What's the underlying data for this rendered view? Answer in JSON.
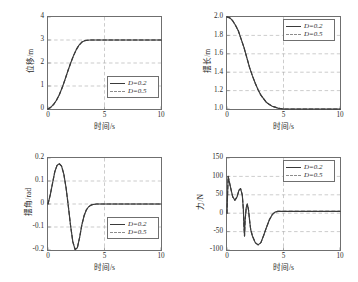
{
  "figure": {
    "background": "#ffffff",
    "axis_color": "#6f6f6f",
    "grid_color": "#a9a9a9",
    "curve_color": "#3a3a3a",
    "dashed_color": "#8d8d8d",
    "caption": ""
  },
  "legend": {
    "series": [
      {
        "label": "D=0.2",
        "style": "solid"
      },
      {
        "label": "D=0.5",
        "style": "dashed"
      }
    ]
  },
  "chart_data": [
    {
      "type": "line",
      "id": "displacement",
      "position": "top-left",
      "title": "",
      "xlabel": "时间/s",
      "ylabel": "位移/m",
      "xlim": [
        0,
        10
      ],
      "ylim": [
        0,
        4
      ],
      "xticks": [
        0,
        5,
        10
      ],
      "yticks": [
        0,
        1,
        2,
        3,
        4
      ],
      "grid": true,
      "legend_position": "lower-right",
      "series": [
        {
          "name": "D=0.2",
          "style": "solid",
          "x": [
            0,
            0.25,
            0.5,
            0.75,
            1.0,
            1.25,
            1.5,
            1.75,
            2.0,
            2.25,
            2.5,
            2.75,
            3.0,
            3.25,
            3.5,
            3.75,
            4.0,
            4.5,
            5.0,
            6.0,
            7.0,
            8.0,
            9.0,
            10.0
          ],
          "y": [
            0.0,
            0.08,
            0.2,
            0.38,
            0.62,
            0.92,
            1.27,
            1.64,
            1.99,
            2.31,
            2.58,
            2.78,
            2.91,
            2.97,
            2.99,
            3.0,
            3.0,
            3.0,
            3.0,
            3.0,
            3.0,
            3.0,
            3.0,
            3.0
          ]
        },
        {
          "name": "D=0.5",
          "style": "dashed",
          "x": [
            0,
            0.25,
            0.5,
            0.75,
            1.0,
            1.25,
            1.5,
            1.75,
            2.0,
            2.25,
            2.5,
            2.75,
            3.0,
            3.25,
            3.5,
            3.75,
            4.0,
            4.5,
            5.0,
            6.0,
            7.0,
            8.0,
            9.0,
            10.0
          ],
          "y": [
            0.0,
            0.08,
            0.2,
            0.38,
            0.62,
            0.92,
            1.27,
            1.64,
            1.99,
            2.31,
            2.58,
            2.78,
            2.91,
            2.97,
            2.99,
            3.0,
            3.0,
            3.0,
            3.0,
            3.0,
            3.0,
            3.0,
            3.0,
            3.0
          ]
        }
      ]
    },
    {
      "type": "line",
      "id": "pendulum-length",
      "position": "top-right",
      "title": "",
      "xlabel": "时间/s",
      "ylabel": "摆长/m",
      "xlim": [
        0,
        10
      ],
      "ylim": [
        1.0,
        2.0
      ],
      "xticks": [
        0,
        5,
        10
      ],
      "yticks": [
        1.0,
        1.2,
        1.4,
        1.6,
        1.8,
        2.0
      ],
      "ytick_labels": [
        "1.0",
        "1.2",
        "1.4",
        "1.6",
        "1.8",
        "2.0"
      ],
      "grid": true,
      "legend_position": "upper-right",
      "series": [
        {
          "name": "D=0.2",
          "style": "solid",
          "x": [
            0,
            0.25,
            0.5,
            0.75,
            1.0,
            1.25,
            1.5,
            1.75,
            2.0,
            2.25,
            2.5,
            2.75,
            3.0,
            3.25,
            3.5,
            3.75,
            4.0,
            4.25,
            4.5,
            5.0,
            5.5,
            6.0,
            7.0,
            8.0,
            9.0,
            10.0
          ],
          "y": [
            2.0,
            1.99,
            1.96,
            1.91,
            1.85,
            1.76,
            1.67,
            1.56,
            1.45,
            1.36,
            1.28,
            1.21,
            1.15,
            1.11,
            1.07,
            1.05,
            1.03,
            1.02,
            1.01,
            1.0,
            1.0,
            1.0,
            1.0,
            1.0,
            1.0,
            1.0
          ]
        },
        {
          "name": "D=0.5",
          "style": "dashed",
          "x": [
            0,
            0.25,
            0.5,
            0.75,
            1.0,
            1.25,
            1.5,
            1.75,
            2.0,
            2.25,
            2.5,
            2.75,
            3.0,
            3.25,
            3.5,
            3.75,
            4.0,
            4.25,
            4.5,
            5.0,
            5.5,
            6.0,
            7.0,
            8.0,
            9.0,
            10.0
          ],
          "y": [
            2.0,
            1.99,
            1.96,
            1.91,
            1.85,
            1.76,
            1.67,
            1.56,
            1.45,
            1.36,
            1.28,
            1.21,
            1.15,
            1.11,
            1.07,
            1.05,
            1.03,
            1.02,
            1.01,
            1.0,
            1.0,
            1.0,
            1.0,
            1.0,
            1.0,
            1.0
          ]
        }
      ]
    },
    {
      "type": "line",
      "id": "swing-angle",
      "position": "bottom-left",
      "title": "",
      "xlabel": "时间/s",
      "ylabel": "摆角/rad",
      "xlim": [
        0,
        10
      ],
      "ylim": [
        -0.2,
        0.2
      ],
      "xticks": [
        0,
        5,
        10
      ],
      "yticks": [
        -0.2,
        -0.1,
        0,
        0.1,
        0.2
      ],
      "ytick_labels": [
        "-0.2",
        "-0.1",
        "0",
        "0.1",
        "0.2"
      ],
      "grid": true,
      "legend_position": "lower-right",
      "series": [
        {
          "name": "D=0.2",
          "style": "solid",
          "x": [
            0,
            0.2,
            0.4,
            0.6,
            0.8,
            1.0,
            1.2,
            1.4,
            1.6,
            1.8,
            2.0,
            2.2,
            2.4,
            2.6,
            2.8,
            3.0,
            3.2,
            3.4,
            3.6,
            3.8,
            4.0,
            4.3,
            4.6,
            5.0,
            6.0,
            7.0,
            8.0,
            9.0,
            10.0
          ],
          "y": [
            0.0,
            0.04,
            0.09,
            0.14,
            0.168,
            0.175,
            0.165,
            0.13,
            0.07,
            -0.01,
            -0.095,
            -0.165,
            -0.198,
            -0.19,
            -0.145,
            -0.09,
            -0.05,
            -0.025,
            -0.012,
            -0.005,
            -0.002,
            0.0,
            0.0,
            0.0,
            0.0,
            0.0,
            0.0,
            0.0,
            0.0
          ]
        },
        {
          "name": "D=0.5",
          "style": "dashed",
          "x": [
            0,
            0.2,
            0.4,
            0.6,
            0.8,
            1.0,
            1.2,
            1.4,
            1.6,
            1.8,
            2.0,
            2.2,
            2.4,
            2.6,
            2.8,
            3.0,
            3.2,
            3.4,
            3.6,
            3.8,
            4.0,
            4.3,
            4.6,
            5.0,
            6.0,
            7.0,
            8.0,
            9.0,
            10.0
          ],
          "y": [
            0.0,
            0.04,
            0.09,
            0.14,
            0.168,
            0.175,
            0.165,
            0.13,
            0.07,
            -0.01,
            -0.095,
            -0.165,
            -0.198,
            -0.19,
            -0.145,
            -0.09,
            -0.05,
            -0.025,
            -0.012,
            -0.005,
            -0.002,
            0.0,
            0.0,
            0.0,
            0.0,
            0.0,
            0.0,
            0.0,
            0.0
          ]
        }
      ]
    },
    {
      "type": "line",
      "id": "force",
      "position": "bottom-right",
      "title": "",
      "xlabel": "时间/s",
      "ylabel": "力/N",
      "xlim": [
        0,
        10
      ],
      "ylim": [
        -100,
        150
      ],
      "xticks": [
        0,
        5,
        10
      ],
      "yticks": [
        -100,
        -50,
        0,
        50,
        100,
        150
      ],
      "ytick_labels": [
        "-100",
        "-50",
        "0",
        "50",
        "100",
        "150"
      ],
      "grid": true,
      "legend_position": "upper-right",
      "series": [
        {
          "name": "D=0.2",
          "style": "solid",
          "x": [
            0,
            0.1,
            0.3,
            0.5,
            0.7,
            0.9,
            1.05,
            1.2,
            1.35,
            1.45,
            1.5,
            1.55,
            1.6,
            1.7,
            1.8,
            1.9,
            2.0,
            2.1,
            2.25,
            2.5,
            2.75,
            3.0,
            3.25,
            3.5,
            3.75,
            4.0,
            4.25,
            4.5,
            5.0,
            5.5,
            6.0,
            7.0,
            8.0,
            9.0,
            10.0
          ],
          "y": [
            0,
            100,
            72,
            45,
            35,
            45,
            62,
            67,
            50,
            10,
            -35,
            -62,
            -20,
            15,
            25,
            10,
            -20,
            -45,
            -62,
            -80,
            -86,
            -80,
            -60,
            -38,
            -18,
            -4,
            3,
            5,
            5,
            5,
            5,
            5,
            5,
            5,
            5
          ]
        },
        {
          "name": "D=0.5",
          "style": "dashed",
          "x": [
            0,
            0.1,
            0.3,
            0.5,
            0.7,
            0.9,
            1.05,
            1.2,
            1.35,
            1.45,
            1.5,
            1.55,
            1.6,
            1.7,
            1.8,
            1.9,
            2.0,
            2.1,
            2.25,
            2.5,
            2.75,
            3.0,
            3.25,
            3.5,
            3.75,
            4.0,
            4.25,
            4.5,
            5.0,
            5.5,
            6.0,
            7.0,
            8.0,
            9.0,
            10.0
          ],
          "y": [
            0,
            100,
            72,
            45,
            35,
            45,
            62,
            67,
            50,
            10,
            -35,
            -62,
            -20,
            15,
            25,
            10,
            -20,
            -45,
            -62,
            -80,
            -86,
            -80,
            -60,
            -38,
            -18,
            -4,
            3,
            5,
            5,
            5,
            5,
            5,
            5,
            5,
            5
          ]
        }
      ]
    }
  ]
}
